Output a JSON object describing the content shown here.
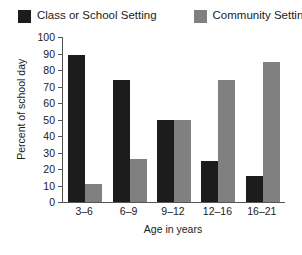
{
  "chart_data": {
    "type": "bar",
    "title": "",
    "xlabel": "Age in years",
    "ylabel": "Percent of school day",
    "categories": [
      "3–6",
      "6–9",
      "9–12",
      "12–16",
      "16–21"
    ],
    "series": [
      {
        "name": "Class or School Setting",
        "color": "#1c1c1c",
        "values": [
          89,
          74,
          50,
          25,
          16
        ]
      },
      {
        "name": "Community Setting",
        "color": "#808080",
        "values": [
          11,
          26,
          50,
          74,
          85
        ]
      }
    ],
    "ylim": [
      0,
      100
    ],
    "yticks": [
      100,
      90,
      80,
      70,
      60,
      50,
      40,
      30,
      20,
      10,
      0
    ],
    "ytick_labels": [
      "100",
      "90",
      "80",
      "70",
      "60",
      "50",
      "40",
      "30",
      "20",
      "10",
      "0"
    ],
    "grid": false,
    "legend_position": "top"
  }
}
